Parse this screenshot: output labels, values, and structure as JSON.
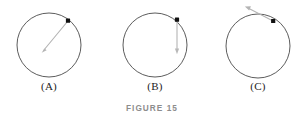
{
  "figure": {
    "caption": "FIGURE 15",
    "background_color": "#ffffff",
    "circle_stroke_color": "#4a4a4a",
    "arrow_color": "#b4b4b4",
    "dot_color": "#111111",
    "label_color": "#1d1d1d",
    "caption_color": "#8d8d8d",
    "panels": [
      {
        "id": "A",
        "label": "(A)",
        "circle": {
          "cx": 49,
          "cy": 45,
          "r": 32
        },
        "dot": {
          "x": 68,
          "y": 21
        },
        "arrow": {
          "description": "radial arrow from point on circle toward center",
          "from_x": 68,
          "from_y": 21,
          "to_x": 42,
          "to_y": 52,
          "head_at": "to"
        }
      },
      {
        "id": "B",
        "label": "(B)",
        "circle": {
          "cx": 155,
          "cy": 45,
          "r": 32
        },
        "dot": {
          "x": 177,
          "y": 20
        },
        "arrow": {
          "description": "vertical downward arrow from point on circle",
          "from_x": 177,
          "from_y": 21,
          "to_x": 177,
          "to_y": 54,
          "head_at": "to"
        }
      },
      {
        "id": "C",
        "label": "(C)",
        "circle": {
          "cx": 258,
          "cy": 46,
          "r": 32
        },
        "dot": {
          "x": 273,
          "y": 21
        },
        "arrow": {
          "description": "tangential arrow from point on circle pointing up-left",
          "from_x": 274,
          "from_y": 22,
          "to_x": 245,
          "to_y": 7,
          "head_at": "to"
        }
      }
    ]
  }
}
